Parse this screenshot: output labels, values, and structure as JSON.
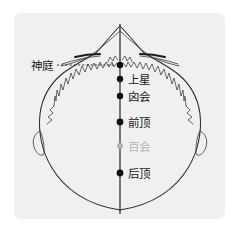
{
  "figure": {
    "background_color": "#ffffff",
    "panel_color": "#f0f0f0",
    "panel": {
      "x": 14,
      "y": 13,
      "width": 211,
      "height": 206,
      "corner_radius": 7
    },
    "midline": {
      "color": "#333333",
      "x": 120,
      "y_top": 24,
      "y_bottom": 214
    }
  },
  "points": [
    {
      "id": "shenting",
      "label": "神庭",
      "color": "#111111",
      "dot_color": "#111111",
      "label_color": "#1a1a1a",
      "cx": 120,
      "cy": 65,
      "radius": 3.2,
      "label_x": 31,
      "label_y": 66,
      "label_anchor": "start",
      "has_leader": true,
      "leader": {
        "x1": 57,
        "y1": 65,
        "x2": 116,
        "y2": 65
      }
    },
    {
      "id": "shangxing",
      "label": "上星",
      "color": "#111111",
      "dot_color": "#111111",
      "label_color": "#1a1a1a",
      "cx": 120,
      "cy": 79,
      "radius": 3.2,
      "label_x": 128,
      "label_y": 80,
      "label_anchor": "start",
      "has_leader": false
    },
    {
      "id": "xinhui",
      "label": "囟会",
      "color": "#111111",
      "dot_color": "#111111",
      "label_color": "#1a1a1a",
      "cx": 120,
      "cy": 96,
      "radius": 3.2,
      "label_x": 128,
      "label_y": 97,
      "label_anchor": "start",
      "has_leader": false
    },
    {
      "id": "qianding",
      "label": "前顶",
      "color": "#111111",
      "dot_color": "#111111",
      "label_color": "#1a1a1a",
      "cx": 120,
      "cy": 122,
      "radius": 3.4,
      "label_x": 128,
      "label_y": 123,
      "label_anchor": "start",
      "has_leader": false
    },
    {
      "id": "baihui",
      "label": "百会",
      "color": "#b0b0b0",
      "dot_color": "#b3b3b3",
      "label_color": "#b5b5b5",
      "cx": 120,
      "cy": 146,
      "radius": 3.0,
      "label_x": 128,
      "label_y": 147,
      "label_anchor": "start",
      "has_leader": false
    },
    {
      "id": "houding",
      "label": "后顶",
      "color": "#111111",
      "dot_color": "#111111",
      "label_color": "#1a1a1a",
      "cx": 120,
      "cy": 173,
      "radius": 3.4,
      "label_x": 128,
      "label_y": 174,
      "label_anchor": "start",
      "has_leader": false
    }
  ],
  "anatomy": {
    "skull_outline_name": "cranial-vault-outline",
    "ear_left_name": "left-ear",
    "ear_right_name": "right-ear",
    "coronal_suture_name": "coronal-suture",
    "sagittal_suture_name": "sagittal-suture",
    "zygomatic_left_name": "left-zygomatic-arch",
    "zygomatic_right_name": "right-zygomatic-arch",
    "nasal_apex_name": "nasal-apex"
  }
}
